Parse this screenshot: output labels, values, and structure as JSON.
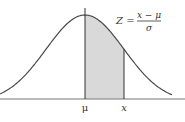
{
  "diagram": {
    "type": "normal-distribution",
    "formula": {
      "lhs": "Z =",
      "numerator": "x − μ",
      "denominator": "σ"
    },
    "axis_labels": {
      "mean": "μ",
      "x": "x"
    },
    "shaded_region": {
      "from": "μ",
      "to": "x",
      "z_value": 1.0
    },
    "colors": {
      "curve": "#4a4a4a",
      "shade": "#d9d9d9",
      "axis": "#777777",
      "text": "#333333"
    }
  }
}
